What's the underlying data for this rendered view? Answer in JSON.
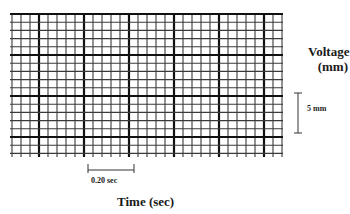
{
  "diagram": {
    "type": "ecg-grid-paper",
    "grid": {
      "x0": 12,
      "y0": 14,
      "x1": 282,
      "y1": 157,
      "minor_dx": 9.0,
      "minor_dy": 8.2,
      "major_every": 5,
      "major_x_offset_cells": 3,
      "major_y_offset_cells": 0,
      "minor_color": "#3a3a3a",
      "major_color": "#111111",
      "minor_width": 1.1,
      "major_width": 2.2
    },
    "y_axis": {
      "label_line1": "Voltage",
      "label_line2": "(mm)",
      "scale_bar": {
        "label": "5 mm",
        "x": 298,
        "y_top": 93,
        "y_bottom": 133
      }
    },
    "x_axis": {
      "label": "Time (sec)",
      "scale_bar": {
        "label": "0.20 sec",
        "y": 170,
        "x_left": 88,
        "x_right": 134
      }
    }
  }
}
